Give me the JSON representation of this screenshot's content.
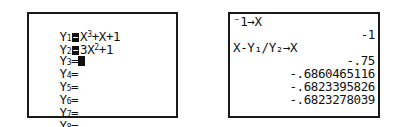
{
  "y_editor": {
    "entries": [
      {
        "label": "Y",
        "index": "1",
        "selected": true,
        "expr_parts": [
          "X",
          "3",
          "+X+1"
        ]
      },
      {
        "label": "Y",
        "index": "2",
        "selected": true,
        "expr_parts": [
          "3X",
          "2",
          "+1"
        ]
      },
      {
        "label": "Y",
        "index": "3",
        "selected": false,
        "equals": "="
      },
      {
        "label": "Y",
        "index": "4",
        "equals": "="
      },
      {
        "label": "Y",
        "index": "5",
        "equals": "="
      },
      {
        "label": "Y",
        "index": "6",
        "equals": "="
      },
      {
        "label": "Y",
        "index": "7",
        "equals": "="
      },
      {
        "label": "Y",
        "index": "8",
        "equals": "="
      }
    ]
  },
  "home_screen": {
    "lines": [
      {
        "text": "⁻1→X",
        "align": "left"
      },
      {
        "text": "-1",
        "align": "right"
      },
      {
        "text": "X-Y₁/Y₂→X",
        "align": "left"
      },
      {
        "text": "-.75",
        "align": "right"
      },
      {
        "text": "-.6860465116",
        "align": "right"
      },
      {
        "text": "-.6823395826",
        "align": "right"
      },
      {
        "text": "-.6823278039",
        "align": "right"
      }
    ]
  }
}
